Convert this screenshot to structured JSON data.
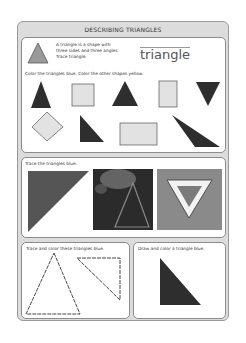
{
  "worksheet": {
    "title": "DESCRIBING TRIANGLES",
    "intro": {
      "line1": "A triangle is a shape with",
      "line2": "three sides and three angles.",
      "line3": "Trace triangle.",
      "trace_word": "triangle"
    },
    "section1": {
      "instruction": "Color the triangles blue.  Color the other shapes yellow.",
      "shapes": [
        "triangle",
        "square",
        "triangle",
        "rectangle",
        "triangle-inverted",
        "diamond",
        "right-triangle",
        "rectangle",
        "obtuse-triangle"
      ]
    },
    "section2": {
      "instruction": "Trace the triangles blue.",
      "images": [
        "triangle-flag",
        "triangle-photo",
        "yield-sign"
      ]
    },
    "section3": {
      "instruction": "Trace and color these triangles blue."
    },
    "section4": {
      "instruction": "Draw and color a triangle blue."
    }
  },
  "colors": {
    "frame": "#dcdcdc",
    "shape_dark": "#2e2e2e",
    "shape_light": "#e2e2e2",
    "example_triangle": "#9a9a9a"
  }
}
